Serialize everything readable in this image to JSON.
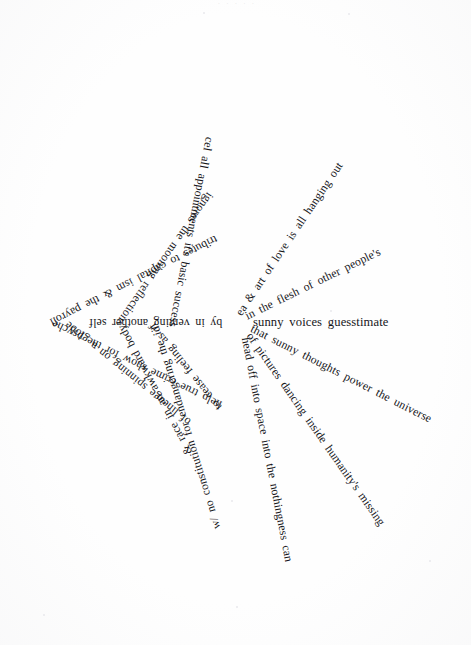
{
  "document": {
    "kind": "radial concrete poem",
    "header_trace": "· · · · ·",
    "center_anchor": {
      "x": 237,
      "y": 322
    },
    "page": {
      "width": 471,
      "height": 645,
      "background": "#fefefe"
    },
    "ink_color": "#16161a"
  },
  "spokes": [
    {
      "id": "spoke-endangering-the-id",
      "text": "w/ no constitution  for endangering the id",
      "angle_deg": -107,
      "start_radius": 14,
      "font_size": 11.8
    },
    {
      "id": "spoke-hanging-out",
      "text": "ea & art of love is all  hanging out",
      "angle_deg": -56,
      "start_radius": 12,
      "font_size": 11.8
    },
    {
      "id": "spoke-other-peoples",
      "text": "in the flesh of   other people's",
      "angle_deg": -26,
      "start_radius": 13,
      "font_size": 11.8
    },
    {
      "id": "spoke-guesstimate",
      "text": "sunny voices   guesstimate",
      "angle_deg": 0,
      "start_radius": 16,
      "font_size": 12.6
    },
    {
      "id": "spoke-power-the-universe",
      "text": "that sunny thoughts power the universe",
      "angle_deg": 27,
      "start_radius": 13,
      "font_size": 11.8
    },
    {
      "id": "spoke-humanitys-missing",
      "text": "of pictures      dancing inside humanity's missing",
      "angle_deg": 55,
      "start_radius": 12,
      "font_size": 11.8
    },
    {
      "id": "spoke-nothingness-can",
      "text": "head off     into space into the nothingness can",
      "angle_deg": 79,
      "start_radius": 11,
      "font_size": 11.8
    },
    {
      "id": "spoke-basic-success",
      "text": "cel   all appointments     it's basic     success",
      "angle_deg": 101,
      "start_radius": 11,
      "font_size": 11.8
    },
    {
      "id": "spoke-mooning-reflections",
      "text": "ignores    the mooning reflections",
      "angle_deg": 125,
      "start_radius": 12,
      "font_size": 11.8
    },
    {
      "id": "spoke-capitalism-payroll",
      "text": "tributes to capital  ism & the payroll",
      "angle_deg": 153,
      "start_radius": 13,
      "font_size": 11.8
    },
    {
      "id": "spoke-another-self",
      "text": "by in  venting another   self",
      "angle_deg": 180,
      "start_radius": 15,
      "font_size": 11.8
    },
    {
      "id": "spoke-for-the-psyche",
      "text": "help true crime show   for the psyche",
      "angle_deg": -154,
      "start_radius": 13,
      "font_size": 11.8
    },
    {
      "id": "spoke-feeling-as-if",
      "text": "to cease feeling  as if",
      "angle_deg": -129,
      "start_radius": 13,
      "font_size": 11.8
    },
    {
      "id": "spoke-spinning-on-a-globe",
      "text": "of lineage     spinning on a globe",
      "angle_deg": -141,
      "start_radius": 44,
      "font_size": 11.8
    },
    {
      "id": "spoke-awkward-body",
      "text": "& race in an awkward body",
      "angle_deg": -118,
      "start_radius": 42,
      "font_size": 11.8
    }
  ],
  "specks": [
    {
      "x": 203,
      "y": 12,
      "size": 2
    },
    {
      "x": 348,
      "y": 13,
      "size": 2
    },
    {
      "x": 330,
      "y": 310,
      "size": 2
    },
    {
      "x": 231,
      "y": 500,
      "size": 2
    },
    {
      "x": 236,
      "y": 606,
      "size": 2
    },
    {
      "x": 429,
      "y": 560,
      "size": 2
    },
    {
      "x": 43,
      "y": 614,
      "size": 2
    }
  ]
}
